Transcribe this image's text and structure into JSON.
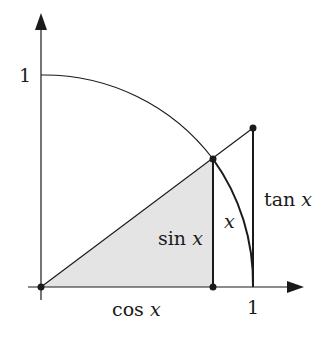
{
  "diagram": {
    "type": "unit-circle-trig",
    "labels": {
      "y_one": "1",
      "x_one": "1",
      "cos": "cos",
      "sin": "sin",
      "tan": "tan",
      "var": "x",
      "arc": "x"
    },
    "colors": {
      "stroke": "#1a1a1a",
      "shade": "#e4e4e4"
    }
  }
}
